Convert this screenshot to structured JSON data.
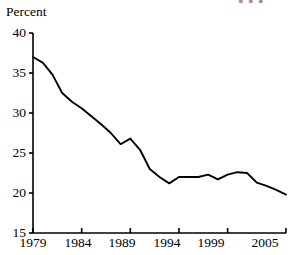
{
  "chart_data": {
    "type": "line",
    "title": "",
    "subtitle": "",
    "xlabel": "",
    "ylabel": "Percent",
    "ylim": [
      15,
      40
    ],
    "xlim": [
      1979,
      2005
    ],
    "yticks": [
      15,
      20,
      25,
      30,
      35,
      40
    ],
    "ytick_labels": [
      "15",
      "20",
      "25",
      "30",
      "35",
      "40"
    ],
    "xticks": [
      1979,
      1984,
      1989,
      1994,
      1999,
      2005
    ],
    "xtick_labels": [
      "1979",
      "1984",
      "1989",
      "1994",
      "1999",
      "2005"
    ],
    "grid": false,
    "legend": null,
    "legend_position": "none",
    "annotations": [],
    "series": [
      {
        "name": "Percent",
        "color": "#000000",
        "x": [
          1979,
          1980,
          1981,
          1982,
          1983,
          1984,
          1985,
          1986,
          1987,
          1988,
          1989,
          1990,
          1991,
          1992,
          1993,
          1994,
          1995,
          1996,
          1997,
          1998,
          1999,
          2000,
          2001,
          2002,
          2003,
          2004,
          2005
        ],
        "values": [
          37.0,
          36.3,
          34.8,
          32.5,
          31.4,
          30.6,
          29.6,
          28.6,
          27.5,
          26.1,
          26.8,
          25.4,
          23.0,
          22.0,
          21.2,
          22.0,
          22.0,
          22.0,
          22.3,
          21.7,
          22.3,
          22.6,
          22.5,
          21.3,
          20.9,
          20.4,
          19.8
        ]
      }
    ]
  },
  "tick_geometry": {
    "y": [
      {
        "label": "40",
        "top": 26
      },
      {
        "label": "35",
        "top": 66
      },
      {
        "label": "30",
        "top": 106
      },
      {
        "label": "25",
        "top": 146
      },
      {
        "label": "20",
        "top": 186
      },
      {
        "label": "15",
        "top": 226
      }
    ],
    "x": [
      {
        "label": "1979",
        "left": 11
      },
      {
        "label": "1984",
        "left": 56
      },
      {
        "label": "1989",
        "left": 100
      },
      {
        "label": "1994",
        "left": 145
      },
      {
        "label": "1999",
        "left": 189
      },
      {
        "label": "2005",
        "left": 243
      }
    ]
  },
  "artifact": {
    "text": "▮ ▮ ▮"
  }
}
